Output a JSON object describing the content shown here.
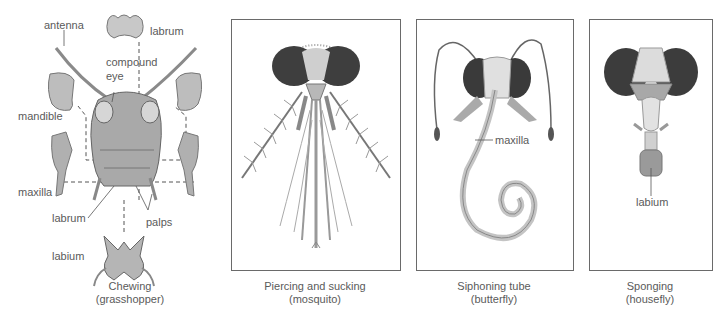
{
  "panels": [
    {
      "id": "chewing",
      "caption_line1": "Chewing",
      "caption_line2": "(grasshopper)",
      "labels": {
        "antenna": "antenna",
        "labrum_top": "labrum",
        "compound_eye_1": "compound",
        "compound_eye_2": "eye",
        "mandible": "mandible",
        "maxilla": "maxilla",
        "labrum_bottom": "labrum",
        "palps": "palps",
        "labium": "labium"
      }
    },
    {
      "id": "piercing",
      "caption_line1": "Piercing and sucking",
      "caption_line2": "(mosquito)"
    },
    {
      "id": "siphoning",
      "caption_line1": "Siphoning tube",
      "caption_line2": "(butterfly)",
      "labels": {
        "maxilla": "maxilla"
      }
    },
    {
      "id": "sponging",
      "caption_line1": "Sponging",
      "caption_line2": "(housefly)",
      "labels": {
        "labium": "labium"
      }
    }
  ],
  "colors": {
    "line": "#5a5a5a",
    "panel_border": "#6a6a6a",
    "eye_dark": "#3c3c3c",
    "tissue": "#bdbdbd",
    "tissue_light": "#d9d9d9"
  }
}
